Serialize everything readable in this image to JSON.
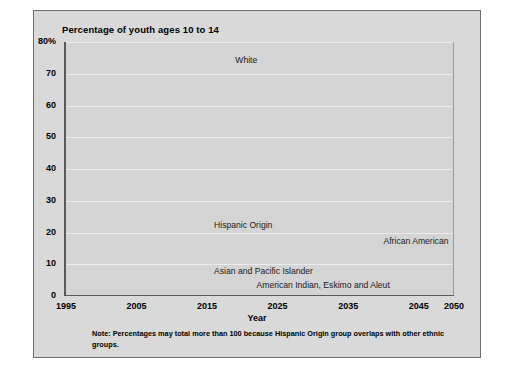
{
  "chart_data": {
    "type": "line",
    "title": "Percentage of youth ages 10 to 14",
    "xlabel": "Year",
    "ylabel": "",
    "note": "Note: Percentages may total more than 100 because Hispanic Origin group overlaps with other ethnic groups.",
    "x": [
      1995,
      2005,
      2015,
      2025,
      2035,
      2045,
      2050
    ],
    "xlim": [
      1995,
      2050
    ],
    "ylim": [
      0,
      80
    ],
    "grid": true,
    "legend_position": "inline-labels",
    "x_tick_labels": [
      "1995",
      "2005",
      "2015",
      "2025",
      "2035",
      "2045",
      "2050"
    ],
    "y_tick_labels": [
      "0",
      "10",
      "20",
      "30",
      "40",
      "50",
      "60",
      "70",
      "80%"
    ],
    "y_ticks": [
      0,
      10,
      20,
      30,
      40,
      50,
      60,
      70,
      80
    ],
    "series": [
      {
        "name": "White",
        "color": "#6d6d6d",
        "label_x": 2019,
        "label_y": 74,
        "values": [
          80,
          77,
          74.5,
          71,
          70.5,
          68.5,
          67
        ]
      },
      {
        "name": "Hispanic Origin",
        "color": "#9a9a9a",
        "label_x": 2016,
        "label_y": 22,
        "values": [
          13.5,
          16.5,
          19,
          21,
          23,
          25.5,
          27
        ]
      },
      {
        "name": "African American",
        "color": "#3a3a3a",
        "label_x": 2040,
        "label_y": 17,
        "values": [
          15,
          16,
          17,
          18,
          18.5,
          19,
          19.5
        ]
      },
      {
        "name": "Asian and Pacific Islander",
        "color": "#111111",
        "label_x": 2016,
        "label_y": 7.5,
        "values": [
          3.8,
          5.3,
          6.3,
          8.3,
          9.3,
          10,
          10
        ]
      },
      {
        "name": "American Indian, Eskimo and Aleut",
        "color": "#8a8a8a",
        "label_x": 2022,
        "label_y": 3.2,
        "values": [
          1,
          1,
          1,
          1,
          1.2,
          1.4,
          1.5
        ]
      }
    ]
  }
}
